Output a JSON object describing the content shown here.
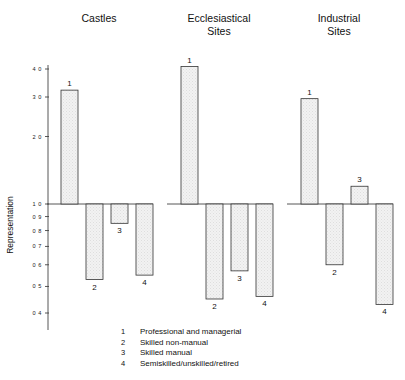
{
  "chart_data": {
    "type": "bar",
    "title": "",
    "subtitle": "",
    "xlabel": "",
    "ylabel": "Representation",
    "yscale": "log",
    "ylim": [
      0.4,
      4.3
    ],
    "baseline": 1.0,
    "grid": false,
    "legend_position": "bottom",
    "ytick_labels": [
      "4 0",
      "3 0",
      "2 0",
      "1 0",
      "0 9",
      "0 8",
      "0 7",
      "0 6",
      "0 5",
      "0 4"
    ],
    "ytick_values": [
      4.0,
      3.0,
      2.0,
      1.0,
      0.9,
      0.8,
      0.7,
      0.6,
      0.5,
      0.4
    ],
    "categories": [
      "1",
      "2",
      "3",
      "4"
    ],
    "panels": [
      {
        "name": "Castles",
        "title_lines": [
          "Castles"
        ],
        "values": [
          3.22,
          0.53,
          0.85,
          0.55
        ]
      },
      {
        "name": "Ecclesiastical Sites",
        "title_lines": [
          "Ecclesiastical",
          "Sites"
        ],
        "values": [
          4.1,
          0.45,
          0.57,
          0.46
        ]
      },
      {
        "name": "Industrial Sites",
        "title_lines": [
          "Industrial",
          "Sites"
        ],
        "values": [
          2.95,
          0.6,
          1.2,
          0.43
        ]
      }
    ],
    "legend_entries": [
      {
        "key": "1",
        "label": "Professional and managerial"
      },
      {
        "key": "2",
        "label": "Skilled non-manual"
      },
      {
        "key": "3",
        "label": "Skilled manual"
      },
      {
        "key": "4",
        "label": "Semiskilled/unskilled/retired"
      }
    ],
    "colors": {
      "bar_fill": "#efefef",
      "bar_stroke": "#333333",
      "axis": "#444444",
      "text": "#111111",
      "background": "#ffffff"
    }
  }
}
